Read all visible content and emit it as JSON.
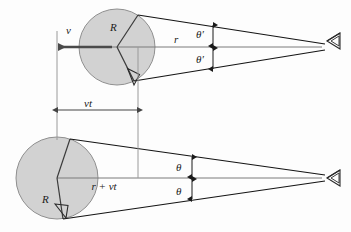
{
  "figure": {
    "background_color": "#fdfdfd",
    "sphere_fill": "#d2d2d2",
    "sphere_stroke": "#8a8a8a",
    "line_color": "#1a1a1a",
    "axis_color": "#6e6e6e",
    "arrow_color": "#555555"
  },
  "panels": [
    {
      "id": "upper",
      "name": "upper-panel",
      "sphere": {
        "cx": 117,
        "cy": 47,
        "r": 38,
        "radius_label": "R"
      },
      "eye": {
        "x": 327,
        "y": 41,
        "label": "eye-icon"
      },
      "labels": {
        "velocity": "v",
        "radius": "R",
        "distance": "r",
        "angle_upper": "θ′",
        "angle_lower": "θ′"
      },
      "right_angle_marker": true
    },
    {
      "id": "lower",
      "name": "lower-panel",
      "sphere": {
        "cx": 57,
        "cy": 178,
        "r": 41,
        "radius_label": "R"
      },
      "eye": {
        "x": 327,
        "y": 178,
        "label": "eye-icon"
      },
      "labels": {
        "radius": "R",
        "distance": "r + vt",
        "angle_upper": "θ",
        "angle_lower": "θ"
      },
      "right_angle_marker": true
    }
  ],
  "measurements": {
    "displacement_label": "vt",
    "displacement_from_x": 57,
    "displacement_to_x": 138
  },
  "symbols": {
    "theta_prime": "θ′",
    "theta": "θ",
    "velocity": "v",
    "radius": "R",
    "distance": "r",
    "distance_shifted": "r + vt",
    "displacement": "vt"
  }
}
